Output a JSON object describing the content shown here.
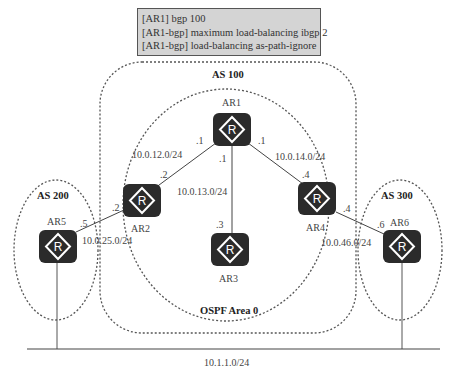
{
  "command_box": {
    "lines": [
      "[AR1] bgp 100",
      "[AR1-bgp] maximum load-balancing ibgp 2",
      "[AR1-bgp] load-balancing as-path-ignore"
    ],
    "background": "#d4d4d4"
  },
  "areas": {
    "as100": "AS 100",
    "as200": "AS 200",
    "as300": "AS 300",
    "ospf": "OSPF Area 0"
  },
  "routers": {
    "ar1": "AR1",
    "ar2": "AR2",
    "ar3": "AR3",
    "ar4": "AR4",
    "ar5": "AR5",
    "ar6": "AR6",
    "icon_letter": "R"
  },
  "networks": {
    "ar1_ar2": "10.0.12.0/24",
    "ar1_ar3": "10.0.13.0/24",
    "ar1_ar4": "10.0.14.0/24",
    "ar2_ar5": "10.0.25.0/24",
    "ar4_ar6": "10.0.46.0/24",
    "lan": "10.1.1.0/24"
  },
  "interfaces": {
    "ar1_to_ar2": ".1",
    "ar1_to_ar3": ".1",
    "ar1_to_ar4": ".1",
    "ar2_to_ar1": ".2",
    "ar2_to_ar5": ".2",
    "ar3_to_ar1": ".3",
    "ar4_to_ar1": ".4",
    "ar4_to_ar6": ".4",
    "ar5_to_ar2": ".5",
    "ar6_to_ar4": ".6"
  },
  "colors": {
    "router_fill": "#2b2b2b",
    "line": "#444444"
  }
}
